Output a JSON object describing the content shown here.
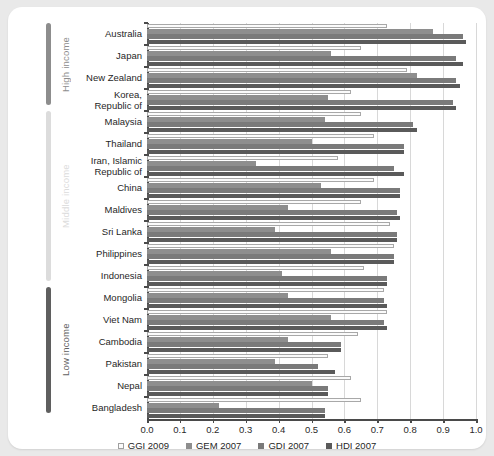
{
  "chart_data": {
    "type": "bar",
    "orientation": "horizontal",
    "title": "",
    "xlabel": "",
    "ylabel": "",
    "xlim": [
      0.0,
      1.0
    ],
    "xticks": [
      "0.0",
      "0.1",
      "0.2",
      "0.3",
      "0.4",
      "0.5",
      "0.6",
      "0.7",
      "0.8",
      "0.9",
      "1.0"
    ],
    "xtick_values": [
      0.0,
      0.1,
      0.2,
      0.3,
      0.4,
      0.5,
      0.6,
      0.7,
      0.8,
      0.9,
      1.0
    ],
    "grid": true,
    "legend_position": "bottom",
    "categories": [
      "Australia",
      "Japan",
      "New Zealand",
      "Korea,\nRepublic of",
      "Malaysia",
      "Thailand",
      "Iran, Islamic\nRepublic of",
      "China",
      "Maldives",
      "Sri Lanka",
      "Philippines",
      "Indonesia",
      "Mongolia",
      "Viet Nam",
      "Cambodia",
      "Pakistan",
      "Nepal",
      "Bangladesh"
    ],
    "series": [
      {
        "name": "GGI 2009",
        "color": "#fbfbfb",
        "values": [
          0.73,
          0.65,
          0.79,
          0.62,
          0.65,
          0.69,
          0.58,
          0.69,
          0.65,
          0.74,
          0.75,
          0.66,
          0.72,
          0.73,
          0.64,
          0.55,
          0.62,
          0.65
        ]
      },
      {
        "name": "GEM 2007",
        "color": "#8e8e8e",
        "values": [
          0.87,
          0.56,
          0.82,
          0.55,
          0.54,
          0.5,
          0.33,
          0.53,
          0.43,
          0.39,
          0.56,
          0.41,
          0.43,
          0.56,
          0.43,
          0.39,
          0.5,
          0.22
        ]
      },
      {
        "name": "GDI 2007",
        "color": "#7a7a7a",
        "values": [
          0.96,
          0.94,
          0.94,
          0.93,
          0.81,
          0.78,
          0.75,
          0.77,
          0.76,
          0.76,
          0.75,
          0.73,
          0.72,
          0.72,
          0.59,
          0.52,
          0.55,
          0.54
        ]
      },
      {
        "name": "HDI 2007",
        "color": "#5a5a5a",
        "values": [
          0.97,
          0.96,
          0.95,
          0.94,
          0.82,
          0.78,
          0.78,
          0.77,
          0.77,
          0.76,
          0.75,
          0.73,
          0.73,
          0.73,
          0.59,
          0.57,
          0.55,
          0.54
        ]
      }
    ]
  },
  "income_groups": [
    {
      "label": "High income",
      "color": "#8d8d8d",
      "start": 0,
      "end": 3
    },
    {
      "label": "Middle income",
      "color": "#dcdcdc",
      "start": 4,
      "end": 11
    },
    {
      "label": "Low income",
      "color": "#5f5f5f",
      "start": 12,
      "end": 17
    }
  ]
}
